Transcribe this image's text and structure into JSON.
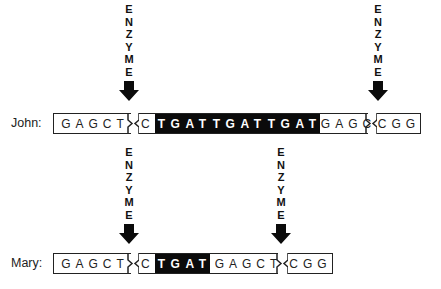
{
  "enzyme_label": [
    "E",
    "N",
    "Z",
    "Y",
    "M",
    "E"
  ],
  "rows": [
    {
      "name": "John",
      "label": "John:",
      "fragments": [
        {
          "segments": [
            {
              "text": "GAGCT",
              "style": "light"
            }
          ]
        },
        {
          "segments": [
            {
              "text": "C",
              "style": "light"
            },
            {
              "text": "TGAT",
              "style": "dark"
            },
            {
              "text": "TGAT",
              "style": "dark"
            },
            {
              "text": "TGAT",
              "style": "dark"
            },
            {
              "text": "GAGCT",
              "style": "light"
            }
          ]
        },
        {
          "segments": [
            {
              "text": "CGG",
              "style": "light"
            }
          ]
        }
      ]
    },
    {
      "name": "Mary",
      "label": "Mary:",
      "fragments": [
        {
          "segments": [
            {
              "text": "GAGCT",
              "style": "light"
            }
          ]
        },
        {
          "segments": [
            {
              "text": "C",
              "style": "light"
            },
            {
              "text": "TGAT",
              "style": "dark"
            },
            {
              "text": "GAGCT",
              "style": "light"
            }
          ]
        },
        {
          "segments": [
            {
              "text": "CGG",
              "style": "light"
            }
          ]
        }
      ]
    }
  ],
  "colors": {
    "ink": "#0b0b0b",
    "background": "#ffffff"
  }
}
